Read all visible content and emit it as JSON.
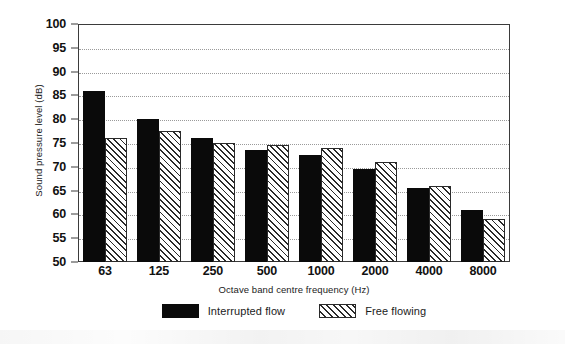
{
  "chart_data": {
    "type": "bar",
    "title": "",
    "xlabel": "Octave band centre frequency (Hz)",
    "ylabel": "Sound pressure level (dB)",
    "categories": [
      "63",
      "125",
      "250",
      "500",
      "1000",
      "2000",
      "4000",
      "8000"
    ],
    "series": [
      {
        "name": "Interrupted flow",
        "fill": "solid-black",
        "color": "#0a0a0a",
        "values": [
          86,
          80,
          76,
          73.5,
          72.5,
          69.5,
          65.5,
          61
        ]
      },
      {
        "name": "Free flowing",
        "fill": "diagonal-hatch",
        "color": "#2a2a2a",
        "values": [
          76,
          77.5,
          75,
          74.5,
          74,
          71,
          66,
          59
        ]
      }
    ],
    "ylim": [
      50,
      100
    ],
    "ytick_step": 5,
    "yticks": [
      "100",
      "95",
      "90",
      "85",
      "80",
      "75",
      "70",
      "65",
      "60",
      "55",
      "50"
    ],
    "grid": true,
    "grid_axis": "y",
    "grid_style": "dotted",
    "legend_position": "bottom-center",
    "frame": true
  },
  "legend": {
    "items": [
      {
        "label": "Interrupted flow",
        "swatch": "solid-black"
      },
      {
        "label": "Free flowing",
        "swatch": "diagonal-hatch"
      }
    ]
  },
  "axes": {
    "y_title": "Sound pressure level (dB)",
    "x_title": "Octave band centre frequency (Hz)"
  }
}
